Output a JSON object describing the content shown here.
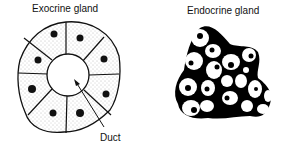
{
  "diagram": {
    "exocrine": {
      "title": "Exocrine gland",
      "duct_label": "Duct",
      "cell_count": 8
    },
    "endocrine": {
      "title": "Endocrine gland"
    }
  }
}
